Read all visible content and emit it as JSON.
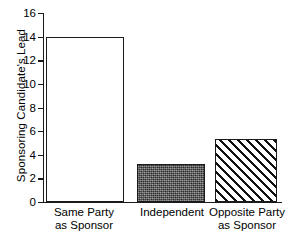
{
  "chart_data": {
    "type": "bar",
    "title": "",
    "xlabel": "",
    "ylabel": "Sponsoring Candidate's Lead",
    "categories": [
      "Same Party as Sponsor",
      "Independent",
      "Opposite Party as Sponsor"
    ],
    "category_lines": [
      [
        "Same Party",
        "as Sponsor"
      ],
      [
        "Independent",
        ""
      ],
      [
        "Opposite Party",
        "as Sponsor"
      ]
    ],
    "values": [
      14.0,
      3.2,
      5.3
    ],
    "ylim": [
      0,
      16
    ],
    "yticks": [
      0,
      2,
      4,
      6,
      8,
      10,
      12,
      14,
      16
    ],
    "ytick_labels": [
      "0",
      "2",
      "4",
      "6",
      "8",
      "10",
      "12",
      "14",
      "16"
    ],
    "grid": false,
    "legend": "none",
    "bar_styles": [
      "open-white",
      "dark-gray-stipple",
      "diagonal-hatch"
    ]
  },
  "caption": {
    "clipped_text": ""
  }
}
